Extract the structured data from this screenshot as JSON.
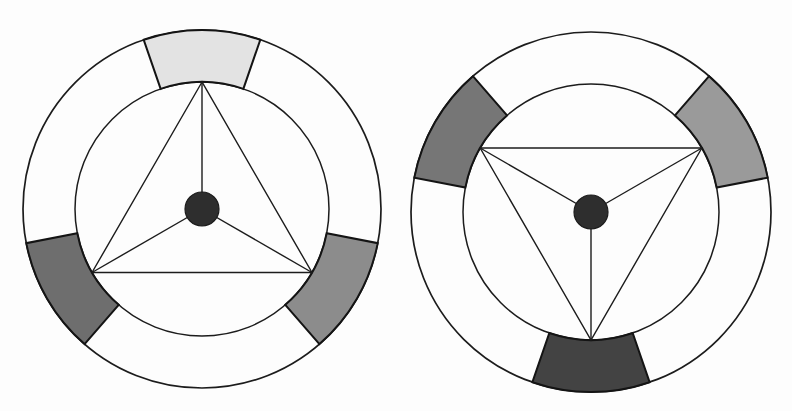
{
  "page": {
    "background_color": "#fdfdfd",
    "width": 792,
    "height": 411,
    "outline_color": "#1c1c1c"
  },
  "chart_data": {
    "type": "diagram",
    "figure_count": 2,
    "figures": [
      {
        "name": "left-figure",
        "label": "Left rotor schematic",
        "center_x": 202,
        "center_y": 209,
        "outer_radius": 179,
        "inner_radius": 127,
        "hub_radius": 17,
        "hub_color": "#2e2e2e",
        "orientation_deg": -90,
        "segment_half_width_deg": 19,
        "vertices": [
          {
            "name": "vertex-top",
            "angle_deg": -90
          },
          {
            "name": "vertex-bottom-left",
            "angle_deg": 150
          },
          {
            "name": "vertex-bottom-right",
            "angle_deg": 30
          }
        ],
        "segments": [
          {
            "name": "segment-top",
            "center_angle_deg": -90,
            "start_angle_deg": -109,
            "end_angle_deg": -71,
            "fill": "#e3e3e3",
            "shade": "light gray"
          },
          {
            "name": "segment-bottom-left",
            "center_angle_deg": 150,
            "start_angle_deg": 131,
            "end_angle_deg": 169,
            "fill": "#6e6e6e",
            "shade": "dark gray"
          },
          {
            "name": "segment-bottom-right",
            "center_angle_deg": 30,
            "start_angle_deg": 11,
            "end_angle_deg": 49,
            "fill": "#8c8c8c",
            "shade": "medium gray"
          }
        ]
      },
      {
        "name": "right-figure",
        "label": "Right rotor schematic",
        "center_x": 591,
        "center_y": 212,
        "outer_radius": 180,
        "inner_radius": 128,
        "hub_radius": 17,
        "hub_color": "#2e2e2e",
        "orientation_deg": 90,
        "segment_half_width_deg": 19,
        "vertices": [
          {
            "name": "vertex-top-left",
            "angle_deg": 210
          },
          {
            "name": "vertex-top-right",
            "angle_deg": -30
          },
          {
            "name": "vertex-bottom",
            "angle_deg": 90
          }
        ],
        "segments": [
          {
            "name": "segment-top-left",
            "center_angle_deg": 210,
            "start_angle_deg": 191,
            "end_angle_deg": 229,
            "fill": "#767676",
            "shade": "dark gray"
          },
          {
            "name": "segment-top-right",
            "center_angle_deg": -30,
            "start_angle_deg": -49,
            "end_angle_deg": -11,
            "fill": "#9a9a9a",
            "shade": "medium gray"
          },
          {
            "name": "segment-bottom",
            "center_angle_deg": 90,
            "start_angle_deg": 71,
            "end_angle_deg": 109,
            "fill": "#434343",
            "shade": "very dark gray"
          }
        ]
      }
    ]
  }
}
